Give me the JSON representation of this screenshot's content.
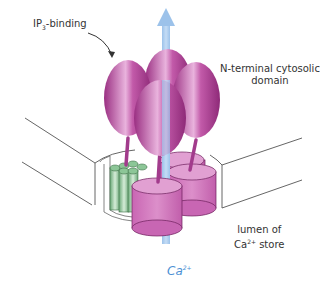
{
  "diagram": {
    "labels": {
      "ip3_binding": {
        "prefix": "IP",
        "sub": "3",
        "suffix": "-binding"
      },
      "n_terminal": {
        "line1": "N-terminal cytosolic",
        "line2": "domain"
      },
      "lumen": {
        "line1": "lumen of",
        "line2_prefix": "Ca",
        "line2_sup": "2+",
        "line2_suffix": " store"
      },
      "calcium": {
        "text": "Ca",
        "sup": "2+"
      }
    },
    "colors": {
      "domain_magenta": "#b8469e",
      "domain_light": "#e6a5d6",
      "channel_pink": "#d47cc2",
      "helix_green": "#7fba8a",
      "helix_light": "#c8e6cc",
      "arrow_blue": "#a7c9ee",
      "membrane_line": "#555555",
      "label_blue": "#4a8fd4"
    }
  }
}
